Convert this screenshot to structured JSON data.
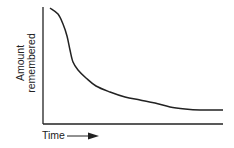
{
  "chart_data": {
    "type": "line",
    "title": "",
    "xlabel": "Time",
    "ylabel": "Amount remembered",
    "ylabel_lines": [
      "Amount",
      "remembered"
    ],
    "x_arrow": true,
    "grid": false,
    "legend": null,
    "ticks": false,
    "series": [
      {
        "name": "Forgetting curve",
        "points_px": [
          [
            50,
            8
          ],
          [
            58,
            14
          ],
          [
            63,
            24
          ],
          [
            67,
            36
          ],
          [
            70,
            50
          ],
          [
            73,
            62
          ],
          [
            78,
            70
          ],
          [
            86,
            78
          ],
          [
            96,
            86
          ],
          [
            110,
            92
          ],
          [
            125,
            97
          ],
          [
            140,
            100
          ],
          [
            155,
            103
          ],
          [
            170,
            107
          ],
          [
            185,
            109
          ],
          [
            200,
            110
          ],
          [
            223,
            110
          ]
        ]
      }
    ]
  },
  "colors": {
    "ink": "#222222",
    "background": "#ffffff"
  }
}
